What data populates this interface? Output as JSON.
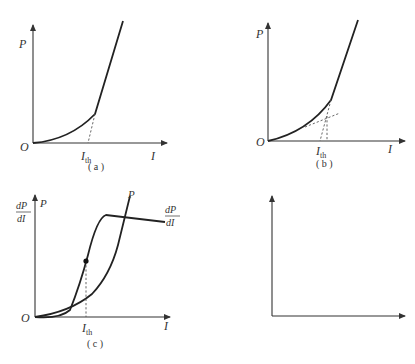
{
  "figure": {
    "panels": [
      {
        "id": "a",
        "caption": "( a )",
        "y_label": "P",
        "x_label": "I",
        "origin_label": "O",
        "threshold_label": "I",
        "threshold_sub": "th",
        "description": "Light power P vs current I; extrapolation of linear region to x-axis gives threshold"
      },
      {
        "id": "b",
        "caption": "( b )",
        "y_label": "P",
        "x_label": "I",
        "origin_label": "O",
        "threshold_label": "I",
        "threshold_sub": "th",
        "description": "Two-segment line fit; intersection determines threshold"
      },
      {
        "id": "c",
        "caption": "( c )",
        "y_label_left_num": "dP",
        "y_label_left_den": "dI",
        "y_label": "P",
        "curve_label_P": "P",
        "curve_label_deriv_num": "dP",
        "curve_label_deriv_den": "dI",
        "x_label": "I",
        "origin_label": "O",
        "threshold_label": "I",
        "threshold_sub": "th",
        "description": "First derivative method; threshold at inflection point of dP/dI"
      },
      {
        "id": "d",
        "caption": "( d )",
        "curve_label_P": "P",
        "curve_label_d2_num": "d²P",
        "curve_label_d2_den": "dI²",
        "x_label": "I",
        "origin_label": "O",
        "description": "Second derivative method; threshold at peak of d²P/dI²"
      }
    ]
  },
  "colors": {
    "background": "#ffffff",
    "line": "#222222",
    "text": "#333333"
  }
}
